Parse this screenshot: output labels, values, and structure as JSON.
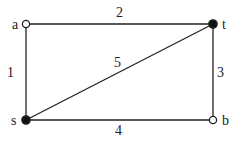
{
  "graph": {
    "nodes": [
      {
        "id": "a",
        "label": "a",
        "x": 26,
        "y": 24,
        "filled": false,
        "label_x": 12,
        "label_y": 29
      },
      {
        "id": "t",
        "label": "t",
        "x": 213,
        "y": 24,
        "filled": true,
        "label_x": 222,
        "label_y": 29
      },
      {
        "id": "s",
        "label": "s",
        "x": 26,
        "y": 120,
        "filled": true,
        "label_x": 11,
        "label_y": 125
      },
      {
        "id": "b",
        "label": "b",
        "x": 213,
        "y": 120,
        "filled": false,
        "label_x": 222,
        "label_y": 125
      }
    ],
    "edges": [
      {
        "from": "a",
        "to": "t",
        "weight": "2",
        "label_x": 116,
        "label_y": 17
      },
      {
        "from": "a",
        "to": "s",
        "weight": "1",
        "label_x": 7,
        "label_y": 77
      },
      {
        "from": "s",
        "to": "t",
        "weight": "5",
        "label_x": 114,
        "label_y": 67
      },
      {
        "from": "t",
        "to": "b",
        "weight": "3",
        "label_x": 217,
        "label_y": 77
      },
      {
        "from": "s",
        "to": "b",
        "weight": "4",
        "label_x": 115,
        "label_y": 135
      }
    ]
  },
  "colors": {
    "line": "#222222",
    "node_fill": "#111111",
    "open_fill": "#ffffff"
  }
}
